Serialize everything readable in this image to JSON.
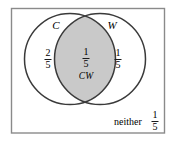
{
  "figure": {
    "type": "venn-diagram",
    "title": "",
    "universe_border_color": "#808080",
    "circle_stroke_color": "#3a3a3a",
    "intersection_fill_color": "#c9c9c9",
    "background_color": "#ffffff",
    "sets": [
      {
        "id": "C",
        "label": "C",
        "position": "left"
      },
      {
        "id": "W",
        "label": "W",
        "position": "right"
      }
    ],
    "regions": [
      {
        "name": "C-only",
        "label": "",
        "value_numerator": "2",
        "value_denominator": "5",
        "shaded": false
      },
      {
        "name": "C-and-W",
        "label": "CW",
        "value_numerator": "1",
        "value_denominator": "5",
        "shaded": true
      },
      {
        "name": "W-only",
        "label": "",
        "value_numerator": "1",
        "value_denominator": "5",
        "shaded": false
      },
      {
        "name": "neither",
        "label": "neither",
        "value_numerator": "1",
        "value_denominator": "5",
        "shaded": false
      }
    ]
  }
}
